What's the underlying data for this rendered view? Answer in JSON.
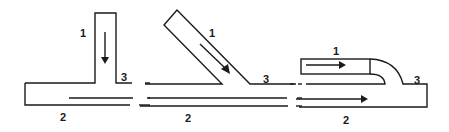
{
  "diagram": {
    "colors": {
      "line": "#1a1a1a",
      "background": "#ffffff"
    },
    "panels": [
      {
        "id": "tee-junction",
        "type": "perpendicular T-junction",
        "labels": {
          "branch": "1",
          "main": "2",
          "outlet": "3"
        },
        "flow_arrows": [
          "branch flow downward"
        ]
      },
      {
        "id": "angled-junction",
        "type": "angled (Y) junction",
        "labels": {
          "branch": "1",
          "main": "2",
          "outlet": "3"
        },
        "flow_arrows": [
          "branch flow diagonally down-right"
        ]
      },
      {
        "id": "parallel-nozzle-junction",
        "type": "parallel nozzle (co-flow) junction",
        "labels": {
          "branch": "1",
          "main": "2",
          "outlet": "3"
        },
        "flow_arrows": [
          "branch flow rightward",
          "main flow rightward"
        ]
      }
    ]
  }
}
